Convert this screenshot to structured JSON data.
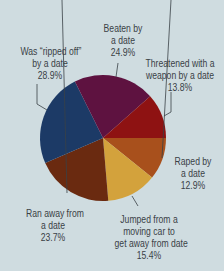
{
  "chart_data": {
    "type": "pie",
    "title": "",
    "note": "Percentages are independent (sum exceeds 100%)",
    "center": [
      103,
      138
    ],
    "radius": 63,
    "slices": [
      {
        "label": "Raped by a date",
        "lines": [
          "Raped by",
          "a date",
          "12.9%"
        ],
        "value": 12.9,
        "color": "#a8501c"
      },
      {
        "label": "Jumped from a moving car to get away from date",
        "lines": [
          "Jumped from a",
          "moving car to",
          "get away from date",
          "15.4%"
        ],
        "value": 15.4,
        "color": "#d3a23c"
      },
      {
        "label": "Ran away from a date",
        "lines": [
          "Ran away from",
          "a date",
          "23.7%"
        ],
        "value": 23.7,
        "color": "#6a2a10"
      },
      {
        "label": "Was \"ripped off\" by a date",
        "lines": [
          "Was “ripped off”",
          "by a date",
          "28.9%"
        ],
        "value": 28.9,
        "color": "#1c3a66"
      },
      {
        "label": "Beaten by a date",
        "lines": [
          "Beaten by",
          "a date",
          "24.9%"
        ],
        "value": 24.9,
        "color": "#5e1240"
      },
      {
        "label": "Threatened with a weapon by a date",
        "lines": [
          "Threatened with a",
          "weapon by a date",
          "13.8%"
        ],
        "value": 13.8,
        "color": "#8e1212"
      }
    ]
  },
  "labels": {
    "raped": {
      "l1": "Raped by",
      "l2": "a date",
      "l3": "12.9%"
    },
    "jumped": {
      "l1": "Jumped from a",
      "l2": "moving car to",
      "l3": "get away from date",
      "l4": "15.4%"
    },
    "ran": {
      "l1": "Ran away from",
      "l2": "a date",
      "l3": "23.7%"
    },
    "ripped": {
      "l1": "Was “ripped off”",
      "l2": "by a date",
      "l3": "28.9%"
    },
    "beaten": {
      "l1": "Beaten by",
      "l2": "a date",
      "l3": "24.9%"
    },
    "threatened": {
      "l1": "Threatened with a",
      "l2": "weapon by a date",
      "l3": "13.8%"
    }
  }
}
